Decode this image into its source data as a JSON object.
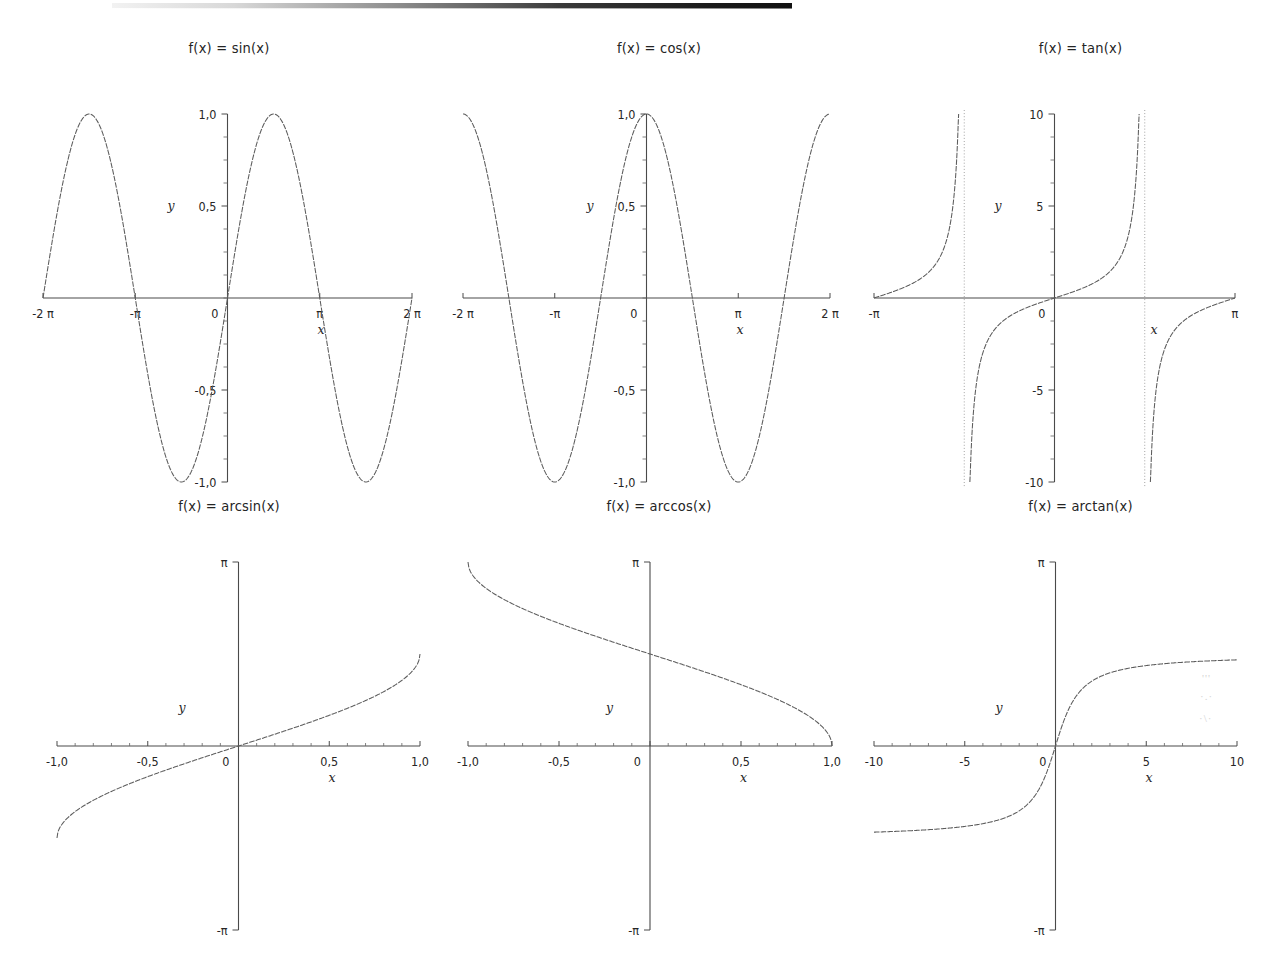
{
  "page": {
    "background_color": "#ffffff",
    "ink_color": "#5c5c5c",
    "axis_color": "#4a4a4a",
    "scan_artifact_label": "top-edge-scan-bar",
    "smudges": [
      "'''",
      "·.·",
      "·\\\\·"
    ]
  },
  "chart_data": [
    {
      "id": "sin",
      "type": "line",
      "title": "f(x) = sin(x)",
      "xlabel": "x",
      "ylabel": "y",
      "xlim": [
        -6.283185,
        6.283185
      ],
      "ylim": [
        -1.0,
        1.0
      ],
      "grid": false,
      "legend": null,
      "xticks": [
        -6.283185,
        -3.141593,
        0,
        3.141593,
        6.283185
      ],
      "xticklabels": [
        "-2 π",
        "-π",
        "0",
        "π",
        "2 π"
      ],
      "yticks": [
        1.0,
        0.5,
        -0.5,
        -1.0
      ],
      "yticklabels": [
        "1,0",
        "0,5",
        "-0,5",
        "-1,0"
      ],
      "y_minor_count": 4,
      "expression": "sin",
      "samples": 420,
      "asymptotes": [],
      "key_points": [
        {
          "x": -6.283185,
          "y": 0
        },
        {
          "x": -4.712389,
          "y": 1.0
        },
        {
          "x": -3.141593,
          "y": 0
        },
        {
          "x": -1.570796,
          "y": -1.0
        },
        {
          "x": 0,
          "y": 0
        },
        {
          "x": 1.570796,
          "y": 1.0
        },
        {
          "x": 3.141593,
          "y": 0
        },
        {
          "x": 4.712389,
          "y": -1.0
        },
        {
          "x": 6.283185,
          "y": 0
        }
      ]
    },
    {
      "id": "cos",
      "type": "line",
      "title": "f(x) = cos(x)",
      "xlabel": "x",
      "ylabel": "y",
      "xlim": [
        -6.283185,
        6.283185
      ],
      "ylim": [
        -1.0,
        1.0
      ],
      "grid": false,
      "legend": null,
      "xticks": [
        -6.283185,
        -3.141593,
        0,
        3.141593,
        6.283185
      ],
      "xticklabels": [
        "-2 π",
        "-π",
        "0",
        "π",
        "2 π"
      ],
      "yticks": [
        1.0,
        0.5,
        -0.5,
        -1.0
      ],
      "yticklabels": [
        "1,0",
        "0,5",
        "-0,5",
        "-1,0"
      ],
      "y_minor_count": 4,
      "expression": "cos",
      "samples": 420,
      "asymptotes": [],
      "key_points": [
        {
          "x": -6.283185,
          "y": 1.0
        },
        {
          "x": -4.712389,
          "y": 0
        },
        {
          "x": -3.141593,
          "y": -1.0
        },
        {
          "x": -1.570796,
          "y": 0
        },
        {
          "x": 0,
          "y": 1.0
        },
        {
          "x": 1.570796,
          "y": 0
        },
        {
          "x": 3.141593,
          "y": -1.0
        },
        {
          "x": 4.712389,
          "y": 0
        },
        {
          "x": 6.283185,
          "y": 1.0
        }
      ]
    },
    {
      "id": "tan",
      "type": "line",
      "title": "f(x) = tan(x)",
      "xlabel": "x",
      "ylabel": "y",
      "xlim": [
        -3.141593,
        3.141593
      ],
      "ylim": [
        -10,
        10
      ],
      "grid": false,
      "legend": null,
      "xticks": [
        -3.141593,
        0,
        3.141593
      ],
      "xticklabels": [
        "-π",
        "0",
        "π"
      ],
      "yticks": [
        10,
        5,
        -5,
        -10
      ],
      "yticklabels": [
        "10",
        "5",
        "-5",
        "-10"
      ],
      "y_minor_count": 4,
      "expression": "tan",
      "samples": 900,
      "asymptotes": [
        -1.570796,
        1.570796
      ],
      "key_points": [
        {
          "x": -3.141593,
          "y": 0
        },
        {
          "x": -1.570796,
          "y": null
        },
        {
          "x": 0,
          "y": 0
        },
        {
          "x": 1.570796,
          "y": null
        },
        {
          "x": 3.141593,
          "y": 0
        }
      ]
    },
    {
      "id": "arcsin",
      "type": "line",
      "title": "f(x) = arcsin(x)",
      "xlabel": "x",
      "ylabel": "y",
      "xlim": [
        -1.0,
        1.0
      ],
      "ylim": [
        -3.141593,
        3.141593
      ],
      "grid": false,
      "legend": null,
      "xticks": [
        -1.0,
        -0.5,
        0,
        0.5,
        1.0
      ],
      "xticklabels": [
        "-1,0",
        "-0,5",
        "0",
        "0,5",
        "1,0"
      ],
      "yticks": [
        3.141593,
        -3.141593
      ],
      "yticklabels": [
        "π",
        "-π"
      ],
      "x_minor_count": 5,
      "expression": "arcsin",
      "samples": 420,
      "asymptotes": [],
      "key_points": [
        {
          "x": -1.0,
          "y": -1.570796
        },
        {
          "x": -0.5,
          "y": -0.523599
        },
        {
          "x": 0,
          "y": 0
        },
        {
          "x": 0.5,
          "y": 0.523599
        },
        {
          "x": 1.0,
          "y": 1.570796
        }
      ]
    },
    {
      "id": "arccos",
      "type": "line",
      "title": "f(x) = arccos(x)",
      "xlabel": "x",
      "ylabel": "y",
      "xlim": [
        -1.0,
        1.0
      ],
      "ylim": [
        -3.141593,
        3.141593
      ],
      "grid": false,
      "legend": null,
      "xticks": [
        -1.0,
        -0.5,
        0,
        0.5,
        1.0
      ],
      "xticklabels": [
        "-1,0",
        "-0,5",
        "0",
        "0,5",
        "1,0"
      ],
      "yticks": [
        3.141593,
        -3.141593
      ],
      "yticklabels": [
        "π",
        "-π"
      ],
      "x_minor_count": 5,
      "expression": "arccos",
      "samples": 420,
      "asymptotes": [],
      "key_points": [
        {
          "x": -1.0,
          "y": 3.141593
        },
        {
          "x": -0.5,
          "y": 2.094395
        },
        {
          "x": 0,
          "y": 1.570796
        },
        {
          "x": 0.5,
          "y": 1.047198
        },
        {
          "x": 1.0,
          "y": 0
        }
      ]
    },
    {
      "id": "arctan",
      "type": "line",
      "title": "f(x) = arctan(x)",
      "xlabel": "x",
      "ylabel": "y",
      "xlim": [
        -10,
        10
      ],
      "ylim": [
        -3.141593,
        3.141593
      ],
      "grid": false,
      "legend": null,
      "xticks": [
        -10,
        -5,
        0,
        5,
        10
      ],
      "xticklabels": [
        "-10",
        "-5",
        "0",
        "5",
        "10"
      ],
      "yticks": [
        3.141593,
        -3.141593
      ],
      "yticklabels": [
        "π",
        "-π"
      ],
      "x_minor_count": 5,
      "expression": "arctan",
      "samples": 520,
      "asymptotes": [],
      "key_points": [
        {
          "x": -10,
          "y": -1.471128
        },
        {
          "x": -5,
          "y": -1.373401
        },
        {
          "x": 0,
          "y": 0
        },
        {
          "x": 5,
          "y": 1.373401
        },
        {
          "x": 10,
          "y": 1.471128
        }
      ]
    }
  ]
}
